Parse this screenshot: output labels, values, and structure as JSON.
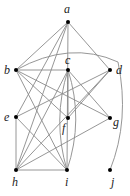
{
  "graph": {
    "nodes": [
      {
        "id": "a",
        "label": "a",
        "x": 68,
        "y": 22,
        "lx": 64,
        "ly": 13
      },
      {
        "id": "b",
        "label": "b",
        "x": 16,
        "y": 70,
        "lx": 4,
        "ly": 74
      },
      {
        "id": "c",
        "label": "c",
        "x": 68,
        "y": 70,
        "lx": 65,
        "ly": 64
      },
      {
        "id": "d",
        "label": "d",
        "x": 110,
        "y": 70,
        "lx": 116,
        "ly": 74
      },
      {
        "id": "e",
        "label": "e",
        "x": 16,
        "y": 117,
        "lx": 4,
        "ly": 121
      },
      {
        "id": "f",
        "label": "f",
        "x": 68,
        "y": 118,
        "lx": 62,
        "ly": 132
      },
      {
        "id": "g",
        "label": "g",
        "x": 110,
        "y": 118,
        "lx": 113,
        "ly": 126
      },
      {
        "id": "h",
        "label": "h",
        "x": 16,
        "y": 170,
        "lx": 12,
        "ly": 186
      },
      {
        "id": "i",
        "label": "i",
        "x": 67,
        "y": 170,
        "lx": 65,
        "ly": 186
      },
      {
        "id": "j",
        "label": "j",
        "x": 110,
        "y": 170,
        "lx": 111,
        "ly": 186
      }
    ],
    "edges": [
      [
        "a",
        "b"
      ],
      [
        "a",
        "d"
      ],
      [
        "a",
        "e"
      ],
      [
        "a",
        "h"
      ],
      [
        "a",
        "i"
      ],
      [
        "b",
        "c"
      ],
      [
        "b",
        "f"
      ],
      [
        "b",
        "g"
      ],
      [
        "b",
        "i"
      ],
      [
        "c",
        "f"
      ],
      [
        "c",
        "h"
      ],
      [
        "c",
        "g"
      ],
      [
        "d",
        "e"
      ],
      [
        "d",
        "h"
      ],
      [
        "d",
        "f"
      ],
      [
        "e",
        "h"
      ],
      [
        "e",
        "i"
      ],
      [
        "g",
        "h"
      ],
      [
        "h",
        "i"
      ],
      [
        "b",
        "j"
      ]
    ],
    "curves": [
      {
        "from": "b",
        "to": "j",
        "path": "M16 70 Q70 40 118 62 Q130 120 110 170"
      },
      {
        "from": "c",
        "to": "i",
        "path": "M68 70 Q52 120 67 170"
      },
      {
        "from": "c",
        "to": "i",
        "path": "M68 70 Q84 120 67 170"
      }
    ]
  }
}
